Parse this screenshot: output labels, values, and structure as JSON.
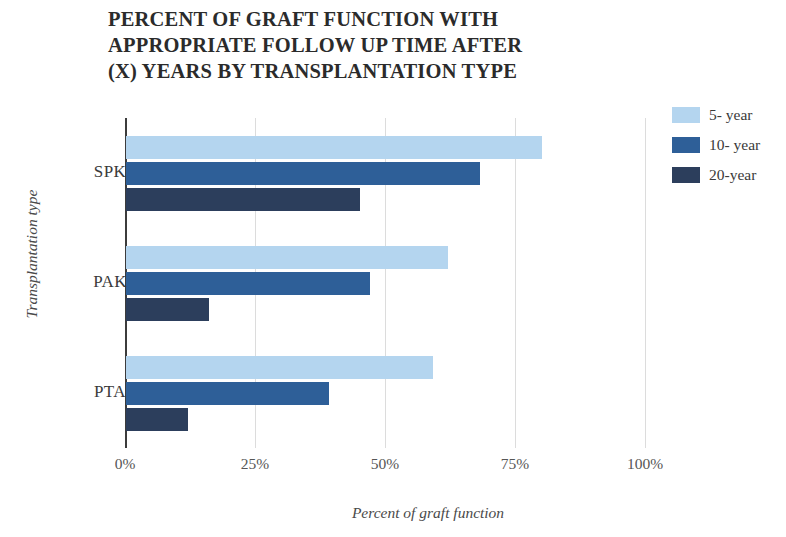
{
  "chart_data": {
    "type": "bar",
    "orientation": "horizontal",
    "title": "PERCENT OF GRAFT FUNCTION WITH APPROPRIATE FOLLOW UP TIME AFTER (X) YEARS BY TRANSPLANTATION TYPE",
    "title_lines": [
      "PERCENT OF GRAFT FUNCTION WITH",
      "APPROPRIATE FOLLOW UP TIME AFTER",
      "(X) YEARS BY TRANSPLANTATION TYPE"
    ],
    "categories": [
      "SPK",
      "PAK",
      "PTA"
    ],
    "series": [
      {
        "name": "5- year",
        "color": "#b4d5ef",
        "values": [
          80,
          62,
          59
        ]
      },
      {
        "name": "10- year",
        "color": "#2e5f98",
        "values": [
          68,
          47,
          39
        ]
      },
      {
        "name": "20-year",
        "color": "#2c3e5c",
        "values": [
          45,
          16,
          12
        ]
      }
    ],
    "xlabel": "Percent of graft function",
    "ylabel": "Transplantation type",
    "xlim": [
      0,
      100
    ],
    "xticks": [
      0,
      25,
      50,
      75,
      100
    ],
    "xtick_labels": [
      "0%",
      "25%",
      "50%",
      "75%",
      "100%"
    ],
    "grid": "vertical",
    "legend_position": "right",
    "value_suffix": "%"
  }
}
